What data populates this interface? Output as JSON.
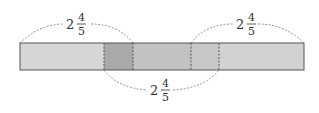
{
  "diagram": {
    "total_segments_units": {
      "note": "Bar divided into left segment, overlap and right segment"
    },
    "segments": [
      {
        "name": "left-part",
        "color": "#d4d4d4"
      },
      {
        "name": "overlap-left",
        "color": "#a8a8a8"
      },
      {
        "name": "middle",
        "color": "#c4c4c4"
      },
      {
        "name": "overlap-right",
        "color": "#c6c6c6"
      },
      {
        "name": "right-part",
        "color": "#d0d0d0"
      }
    ],
    "labels": {
      "top_left": {
        "whole": "2",
        "numerator": "4",
        "denominator": "5"
      },
      "top_right": {
        "whole": "2",
        "numerator": "4",
        "denominator": "5"
      },
      "bottom": {
        "whole": "2",
        "numerator": "4",
        "denominator": "5"
      }
    },
    "stroke_color": "#555555",
    "dash_color": "#777777"
  }
}
